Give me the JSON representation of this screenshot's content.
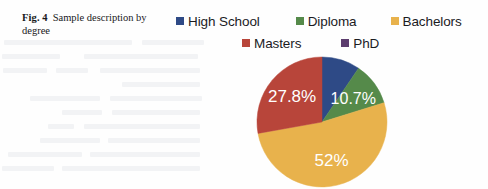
{
  "figure": {
    "number": "Fig. 4",
    "caption": "Sample description by degree"
  },
  "legend": {
    "rows": [
      [
        {
          "label": "High School",
          "color": "#2e4a86",
          "name": "legend-item-high-school"
        },
        {
          "label": "Diploma",
          "color": "#558a4a",
          "name": "legend-item-diploma"
        },
        {
          "label": "Bachelors",
          "color": "#e8b24c",
          "name": "legend-item-bachelors"
        }
      ],
      [
        {
          "label": "Masters",
          "color": "#b8453a",
          "name": "legend-item-masters"
        },
        {
          "label": "PhD",
          "color": "#5c3d6e",
          "name": "legend-item-phd"
        }
      ]
    ]
  },
  "chart_data": {
    "type": "pie",
    "title": "Sample description by degree",
    "categories": [
      "High School",
      "Diploma",
      "Bachelors",
      "Masters",
      "PhD"
    ],
    "values": [
      9.5,
      10.7,
      52,
      27.8,
      0
    ],
    "unit": "%",
    "colors": [
      "#2e4a86",
      "#558a4a",
      "#e8b24c",
      "#b8453a",
      "#5c3d6e"
    ],
    "visible_labels": [
      "",
      "10.7%",
      "52%",
      "27.8%",
      ""
    ],
    "label_color": "#ffffff",
    "start_angle_deg": 0,
    "direction": "clockwise",
    "legend": true,
    "legend_position": "top",
    "grid": false,
    "slices": [
      {
        "name": "High School",
        "value": 9.5,
        "label": "",
        "color": "#2e4a86"
      },
      {
        "name": "Diploma",
        "value": 10.7,
        "label": "10.7%",
        "color": "#558a4a"
      },
      {
        "name": "Bachelors",
        "value": 52,
        "label": "52%",
        "color": "#e8b24c"
      },
      {
        "name": "Masters",
        "value": 27.8,
        "label": "27.8%",
        "color": "#b8453a"
      },
      {
        "name": "PhD",
        "value": 0,
        "label": "",
        "color": "#5c3d6e"
      }
    ],
    "labels": {
      "diploma": "10.7%",
      "bachelors": "52%",
      "masters": "27.8%"
    }
  }
}
